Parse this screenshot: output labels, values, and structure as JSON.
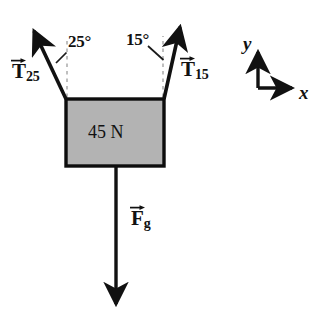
{
  "figure": {
    "background_color": "#ffffff",
    "stroke_color": "#111111",
    "block_fill_color": "#b3b3b3",
    "dashed_guide_color": "#aaaaaa"
  },
  "block": {
    "weight_label": "45 N",
    "fill": "#b3b3b3",
    "x": 66,
    "y": 99,
    "width": 98,
    "height": 67
  },
  "vectors": {
    "tension_left": {
      "label_letter": "T",
      "label_subscript": "25",
      "angle_from_vertical_deg": 25,
      "direction": "up-left",
      "tail": [
        66,
        99
      ],
      "tip": [
        32,
        28
      ]
    },
    "tension_right": {
      "label_letter": "T",
      "label_subscript": "15",
      "angle_from_vertical_deg": 15,
      "direction": "up-right",
      "tail": [
        164,
        99
      ],
      "tip": [
        181,
        24
      ]
    },
    "weight": {
      "label_letter": "F",
      "label_subscript": "g",
      "direction": "down",
      "tail": [
        116,
        166
      ],
      "tip": [
        116,
        308
      ]
    }
  },
  "angles": {
    "left": {
      "value": "25°"
    },
    "right": {
      "value": "15°"
    }
  },
  "axes": {
    "x_label": "x",
    "y_label": "y",
    "origin": [
      258,
      88
    ],
    "x_tip": [
      296,
      88
    ],
    "y_tip": [
      258,
      48
    ]
  }
}
